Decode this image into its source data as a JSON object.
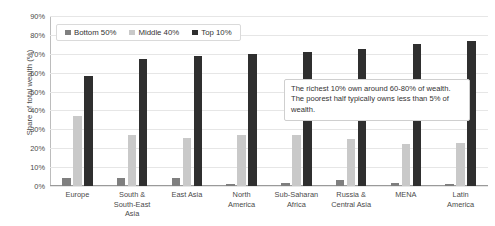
{
  "chart_data": {
    "type": "bar",
    "title": "",
    "xlabel": "",
    "ylabel": "Share of total wealth (%)",
    "ylim": [
      0,
      90
    ],
    "ytick_labels": [
      "90%",
      "80%",
      "70%",
      "60%",
      "50%",
      "40%",
      "30%",
      "20%",
      "10%",
      "0%"
    ],
    "ytick_values": [
      90,
      80,
      70,
      60,
      50,
      40,
      30,
      20,
      10,
      0
    ],
    "grid": true,
    "legend_position": "top-left",
    "categories": [
      "Europe",
      "South & South-East Asia",
      "East Asia",
      "North America",
      "Sub-Saharan Africa",
      "Russia & Central Asia",
      "MENA",
      "Latin America"
    ],
    "category_lines": [
      [
        "Europe"
      ],
      [
        "South &",
        "South-East",
        "Asia"
      ],
      [
        "East Asia"
      ],
      [
        "North",
        "America"
      ],
      [
        "Sub-Saharan",
        "Africa"
      ],
      [
        "Russia &",
        "Central Asia"
      ],
      [
        "MENA"
      ],
      [
        "Latin",
        "America"
      ]
    ],
    "series": [
      {
        "name": "Bottom 50%",
        "color": "#7f7f7f",
        "values": [
          4,
          4,
          4.5,
          1,
          1.5,
          3,
          1.5,
          1
        ]
      },
      {
        "name": "Middle 40%",
        "color": "#c9c9c9",
        "values": [
          37,
          27,
          25.5,
          27,
          27,
          25,
          22.5,
          23
        ]
      },
      {
        "name": "Top 10%",
        "color": "#2f2f2f",
        "values": [
          58,
          67,
          69,
          70,
          71,
          72.5,
          75,
          77
        ]
      }
    ],
    "annotations": [
      {
        "text": "The richest 10% own around 60-80% of wealth. The poorest half typically owns less than 5% of wealth."
      }
    ]
  },
  "legend": {
    "items": [
      {
        "label": "Bottom 50%",
        "color": "#7f7f7f"
      },
      {
        "label": "Middle 40%",
        "color": "#c9c9c9"
      },
      {
        "label": "Top 10%",
        "color": "#2f2f2f"
      }
    ]
  }
}
